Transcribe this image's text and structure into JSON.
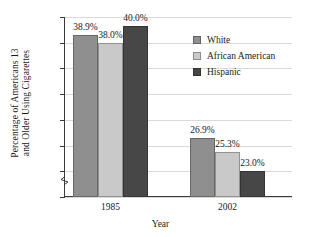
{
  "chart_data": {
    "type": "bar",
    "title": "",
    "xlabel": "Year",
    "ylabel": "Percentage of Americans 13 and Older Using Cigarettes",
    "ylabel_line1": "Percentage of Americans 13",
    "ylabel_line2": "and Older Using Cigarettes",
    "categories": [
      "1985",
      "2002"
    ],
    "series": [
      {
        "name": "White",
        "values": [
          38.9,
          26.9
        ],
        "labels": [
          "38.9%",
          "25.3%"
        ],
        "color": "#8f8f8f"
      },
      {
        "name": "African American",
        "values": [
          38.0,
          25.3
        ],
        "labels": [
          "38.0%",
          "25.3%"
        ],
        "color": "#c9c9c9"
      },
      {
        "name": "Hispanic",
        "values": [
          40.0,
          23.0
        ],
        "labels": [
          "40.0%",
          "23.0%"
        ],
        "color": "#474747"
      }
    ],
    "bar_labels": [
      {
        "text": "38.9%"
      },
      {
        "text": "38.0%"
      },
      {
        "text": "40.0%"
      },
      {
        "text": "26.9%"
      },
      {
        "text": "25.3%"
      },
      {
        "text": "23.0%"
      }
    ],
    "ylim": [
      20,
      41
    ],
    "y_ticks": [
      "20%",
      "23%",
      "26%",
      "29%",
      "32%",
      "35%",
      "38%",
      "41%"
    ],
    "y_tick_values": [
      20,
      23,
      26,
      29,
      32,
      35,
      38,
      41
    ],
    "grid": true,
    "axis_break": true,
    "legend_position": "inside-top-right",
    "legend": [
      "White",
      "African American",
      "Hispanic"
    ]
  }
}
